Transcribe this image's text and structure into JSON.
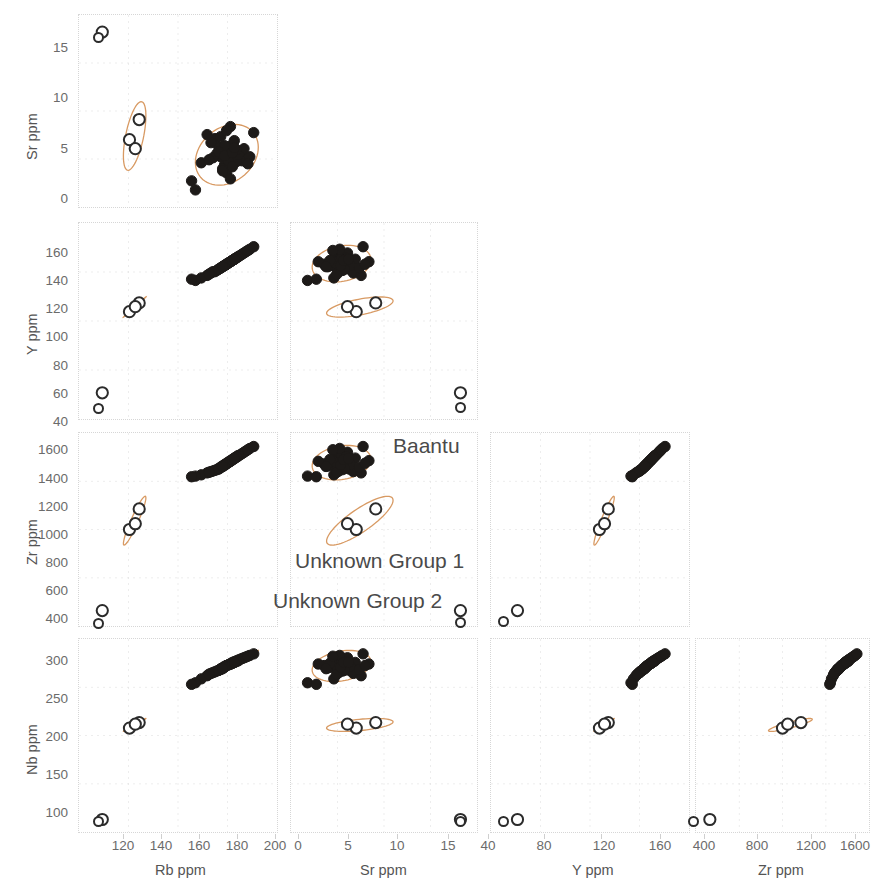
{
  "figure": {
    "kind": "scatter-plot-matrix",
    "background": "#ffffff",
    "ellipse_color": "#d89a63",
    "marker_filled_color": "#1d1a18",
    "marker_open_color": "#2b2b2b",
    "grid_color": "#d6d6d6"
  },
  "legend": {
    "items": [
      {
        "label": "Baantu",
        "style": "filled"
      },
      {
        "label": "Unknown Group 1",
        "style": "open"
      },
      {
        "label": "Unknown Group 2",
        "style": "open"
      }
    ],
    "baantu": "Baantu",
    "group1": "Unknown Group 1",
    "group2": "Unknown Group 2"
  },
  "axes": {
    "x": [
      {
        "name": "Rb ppm",
        "ticks": [
          120,
          140,
          160,
          180,
          200
        ],
        "min": 110,
        "max": 212
      },
      {
        "name": "Sr ppm",
        "ticks": [
          0,
          5,
          10,
          15
        ],
        "min": -1.6,
        "max": 17.5
      },
      {
        "name": "Y ppm",
        "ticks": [
          40,
          80,
          120,
          160
        ],
        "min": 28,
        "max": 185
      },
      {
        "name": "Zr ppm",
        "ticks": [
          400,
          800,
          1200,
          1600
        ],
        "min": 260,
        "max": 1760
      }
    ],
    "y": [
      {
        "name": "Sr ppm",
        "ticks": [
          0,
          5,
          10,
          15
        ],
        "min": -1.6,
        "max": 17.5
      },
      {
        "name": "Y ppm",
        "ticks": [
          40,
          60,
          80,
          100,
          120,
          140,
          160
        ],
        "min": 28,
        "max": 185
      },
      {
        "name": "Zr ppm",
        "ticks": [
          400,
          600,
          800,
          1000,
          1200,
          1400,
          1600
        ],
        "min": 260,
        "max": 1760
      },
      {
        "name": "Nb ppm",
        "ticks": [
          100,
          150,
          200,
          250,
          300
        ],
        "min": 75,
        "max": 322
      }
    ]
  },
  "chart_data": {
    "type": "scatter",
    "title": "",
    "xlabel": "Rb ppm / Sr ppm / Y ppm / Zr ppm",
    "ylabel": "Sr ppm / Y ppm / Zr ppm / Nb ppm",
    "variables": [
      "Rb ppm",
      "Sr ppm",
      "Y ppm",
      "Zr ppm",
      "Nb ppm"
    ],
    "units": "ppm",
    "grid": true,
    "legend_position": "inside-center",
    "confidence_ellipses": true,
    "panels": [
      {
        "row": 0,
        "col": 0,
        "x": "Rb ppm",
        "y": "Sr ppm"
      },
      {
        "row": 1,
        "col": 0,
        "x": "Rb ppm",
        "y": "Y ppm"
      },
      {
        "row": 1,
        "col": 1,
        "x": "Sr ppm",
        "y": "Y ppm"
      },
      {
        "row": 2,
        "col": 0,
        "x": "Rb ppm",
        "y": "Zr ppm"
      },
      {
        "row": 2,
        "col": 1,
        "x": "Sr ppm",
        "y": "Zr ppm"
      },
      {
        "row": 2,
        "col": 2,
        "x": "Y ppm",
        "y": "Zr ppm"
      },
      {
        "row": 3,
        "col": 0,
        "x": "Rb ppm",
        "y": "Nb ppm"
      },
      {
        "row": 3,
        "col": 1,
        "x": "Sr ppm",
        "y": "Nb ppm"
      },
      {
        "row": 3,
        "col": 2,
        "x": "Y ppm",
        "y": "Nb ppm"
      },
      {
        "row": 3,
        "col": 3,
        "x": "Zr ppm",
        "y": "Nb ppm"
      }
    ],
    "series": [
      {
        "name": "Baantu",
        "style": "filled",
        "n": 44,
        "points": [
          {
            "Rb": 186,
            "Sr": 3.6,
            "Y": 152,
            "Zr": 1520,
            "Nb": 288
          },
          {
            "Rb": 188,
            "Sr": 3.3,
            "Y": 154,
            "Zr": 1540,
            "Nb": 290
          },
          {
            "Rb": 184,
            "Sr": 4.0,
            "Y": 150,
            "Zr": 1500,
            "Nb": 285
          },
          {
            "Rb": 190,
            "Sr": 3.1,
            "Y": 156,
            "Zr": 1560,
            "Nb": 293
          },
          {
            "Rb": 182,
            "Sr": 4.4,
            "Y": 148,
            "Zr": 1480,
            "Nb": 282
          },
          {
            "Rb": 192,
            "Sr": 3.5,
            "Y": 158,
            "Zr": 1580,
            "Nb": 295
          },
          {
            "Rb": 180,
            "Sr": 5.2,
            "Y": 146,
            "Zr": 1470,
            "Nb": 280
          },
          {
            "Rb": 194,
            "Sr": 3.0,
            "Y": 160,
            "Zr": 1600,
            "Nb": 297
          },
          {
            "Rb": 178,
            "Sr": 4.8,
            "Y": 145,
            "Zr": 1460,
            "Nb": 278
          },
          {
            "Rb": 187,
            "Sr": 3.8,
            "Y": 153,
            "Zr": 1530,
            "Nb": 289
          },
          {
            "Rb": 185,
            "Sr": 2.6,
            "Y": 151,
            "Zr": 1510,
            "Nb": 286
          },
          {
            "Rb": 189,
            "Sr": 4.6,
            "Y": 155,
            "Zr": 1550,
            "Nb": 291
          },
          {
            "Rb": 183,
            "Sr": 3.4,
            "Y": 149,
            "Zr": 1490,
            "Nb": 284
          },
          {
            "Rb": 191,
            "Sr": 2.9,
            "Y": 157,
            "Zr": 1570,
            "Nb": 294
          },
          {
            "Rb": 176,
            "Sr": 5.6,
            "Y": 143,
            "Zr": 1450,
            "Nb": 275
          },
          {
            "Rb": 196,
            "Sr": 3.2,
            "Y": 162,
            "Zr": 1620,
            "Nb": 299
          },
          {
            "Rb": 186,
            "Sr": 1.8,
            "Y": 152,
            "Zr": 1520,
            "Nb": 288
          },
          {
            "Rb": 188,
            "Sr": 6.4,
            "Y": 154,
            "Zr": 1545,
            "Nb": 290
          },
          {
            "Rb": 181,
            "Sr": 3.7,
            "Y": 147,
            "Zr": 1475,
            "Nb": 281
          },
          {
            "Rb": 193,
            "Sr": 3.9,
            "Y": 159,
            "Zr": 1590,
            "Nb": 296
          },
          {
            "Rb": 184,
            "Sr": 2.2,
            "Y": 150,
            "Zr": 1505,
            "Nb": 285
          },
          {
            "Rb": 190,
            "Sr": 5.0,
            "Y": 156,
            "Zr": 1565,
            "Nb": 292
          },
          {
            "Rb": 179,
            "Sr": 3.3,
            "Y": 146,
            "Zr": 1465,
            "Nb": 279
          },
          {
            "Rb": 195,
            "Sr": 4.2,
            "Y": 161,
            "Zr": 1610,
            "Nb": 298
          },
          {
            "Rb": 187,
            "Sr": 3.0,
            "Y": 153,
            "Zr": 1535,
            "Nb": 289
          },
          {
            "Rb": 185,
            "Sr": 4.5,
            "Y": 151,
            "Zr": 1515,
            "Nb": 287
          },
          {
            "Rb": 189,
            "Sr": 2.4,
            "Y": 155,
            "Zr": 1555,
            "Nb": 291
          },
          {
            "Rb": 183,
            "Sr": 5.4,
            "Y": 149,
            "Zr": 1495,
            "Nb": 283
          },
          {
            "Rb": 192,
            "Sr": 3.6,
            "Y": 158,
            "Zr": 1585,
            "Nb": 294
          },
          {
            "Rb": 173,
            "Sr": 2.8,
            "Y": 141,
            "Zr": 1435,
            "Nb": 271
          },
          {
            "Rb": 198,
            "Sr": 3.4,
            "Y": 164,
            "Zr": 1640,
            "Nb": 301
          },
          {
            "Rb": 186,
            "Sr": 6.0,
            "Y": 152,
            "Zr": 1525,
            "Nb": 288
          },
          {
            "Rb": 188,
            "Sr": 1.2,
            "Y": 154,
            "Zr": 1540,
            "Nb": 290
          },
          {
            "Rb": 182,
            "Sr": 3.9,
            "Y": 148,
            "Zr": 1485,
            "Nb": 282
          },
          {
            "Rb": 191,
            "Sr": 4.1,
            "Y": 157,
            "Zr": 1575,
            "Nb": 293
          },
          {
            "Rb": 177,
            "Sr": 3.1,
            "Y": 144,
            "Zr": 1455,
            "Nb": 277
          },
          {
            "Rb": 197,
            "Sr": 2.7,
            "Y": 163,
            "Zr": 1630,
            "Nb": 300
          },
          {
            "Rb": 185,
            "Sr": 3.5,
            "Y": 151,
            "Zr": 1512,
            "Nb": 286
          },
          {
            "Rb": 189,
            "Sr": 3.8,
            "Y": 155,
            "Zr": 1552,
            "Nb": 292
          },
          {
            "Rb": 170,
            "Sr": 0.1,
            "Y": 139,
            "Zr": 1425,
            "Nb": 266
          },
          {
            "Rb": 200,
            "Sr": 5.8,
            "Y": 166,
            "Zr": 1655,
            "Nb": 303
          },
          {
            "Rb": 184,
            "Sr": 2.0,
            "Y": 150,
            "Zr": 1500,
            "Nb": 284
          },
          {
            "Rb": 190,
            "Sr": 4.3,
            "Y": 156,
            "Zr": 1562,
            "Nb": 292
          },
          {
            "Rb": 168,
            "Sr": 1.0,
            "Y": 140,
            "Zr": 1420,
            "Nb": 264
          }
        ]
      },
      {
        "name": "Unknown Group 1",
        "style": "open",
        "n": 3,
        "points": [
          {
            "Rb": 136,
            "Sr": 5.1,
            "Y": 114,
            "Zr": 1010,
            "Nb": 208
          },
          {
            "Rb": 141,
            "Sr": 7.1,
            "Y": 121,
            "Zr": 1170,
            "Nb": 215
          },
          {
            "Rb": 139,
            "Sr": 4.2,
            "Y": 118,
            "Zr": 1055,
            "Nb": 213
          }
        ]
      },
      {
        "name": "Unknown Group 2",
        "style": "open",
        "n": 1,
        "points": [
          {
            "Rb": 122,
            "Sr": 15.8,
            "Y": 49,
            "Zr": 380,
            "Nb": 91
          }
        ]
      }
    ]
  }
}
